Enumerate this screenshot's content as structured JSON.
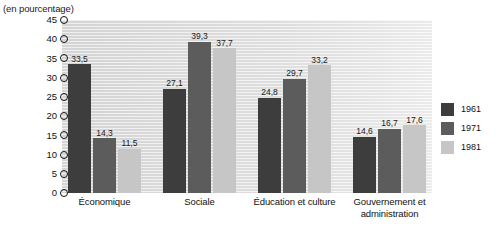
{
  "chart_data": {
    "type": "bar",
    "title": "(en pourcentage)",
    "xlabel": "",
    "ylabel": "",
    "ylim": [
      0,
      45
    ],
    "ytick_step": 5,
    "ytick_labels": [
      "45",
      "40",
      "35",
      "30",
      "25",
      "20",
      "15",
      "10",
      "5",
      "0"
    ],
    "grid": false,
    "legend_position": "right",
    "categories": [
      "Économique",
      "Sociale",
      "Éducation et culture",
      "Gouvernement et administration"
    ],
    "series": [
      {
        "name": "1961",
        "color": "#3d3d3d",
        "values": [
          33.5,
          27.1,
          24.8,
          14.6
        ],
        "labels": [
          "33,5",
          "27,1",
          "24,8",
          "14,6"
        ]
      },
      {
        "name": "1971",
        "color": "#5c5c5c",
        "values": [
          14.3,
          39.3,
          29.7,
          16.7
        ],
        "labels": [
          "14,3",
          "39,3",
          "29,7",
          "16,7"
        ]
      },
      {
        "name": "1981",
        "color": "#c6c6c6",
        "values": [
          11.5,
          37.7,
          33.2,
          17.6
        ],
        "labels": [
          "11,5",
          "37,7",
          "33,2",
          "17,6"
        ]
      }
    ]
  },
  "legend": {
    "items": [
      {
        "label": "1961"
      },
      {
        "label": "1971"
      },
      {
        "label": "1981"
      }
    ]
  },
  "colors": {
    "series_1961": "#3d3d3d",
    "series_1971": "#5c5c5c",
    "series_1981": "#c6c6c6",
    "plot_background": "#e4e4e4",
    "text": "#111111"
  }
}
